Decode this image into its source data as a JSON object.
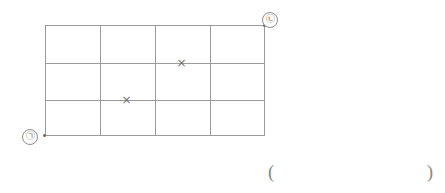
{
  "figure": {
    "background_color": "#ffffff",
    "line_color": "#9a9a9a",
    "mark_color": "#707070",
    "width": 445,
    "height": 193
  },
  "grid": {
    "columns": 4,
    "rows": 3,
    "left": 45,
    "top": 25,
    "width": 220,
    "height": 111,
    "vertical_line_x": [
      0,
      55,
      110,
      165,
      219
    ],
    "horizontal_line_y": [
      0,
      38,
      75,
      110
    ]
  },
  "endpoints": [
    {
      "id": "point-a",
      "label": "㉠",
      "grid_position": "bottom-left",
      "dot_x": 43,
      "dot_y": 134,
      "label_x": 22,
      "label_y": 129
    },
    {
      "id": "point-b",
      "label": "㉡",
      "grid_position": "top-right",
      "dot_x": 263,
      "dot_y": 24,
      "label_x": 262,
      "label_y": 12
    }
  ],
  "markers": [
    {
      "id": "x-mark-upper",
      "symbol": "×",
      "x": 175,
      "y": 57,
      "on_gridline": "horizontal-2",
      "column": 3
    },
    {
      "id": "x-mark-lower",
      "symbol": "×",
      "x": 120,
      "y": 94,
      "on_gridline": "horizontal-3",
      "column": 2
    }
  ],
  "answer": {
    "open_paren": "(",
    "close_paren": ")",
    "value": ""
  }
}
